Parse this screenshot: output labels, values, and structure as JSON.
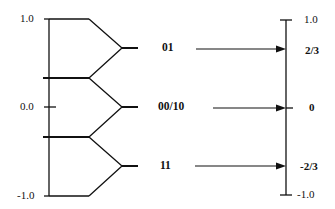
{
  "diagram": {
    "left_axis": {
      "ticks": [
        {
          "label": "1.0",
          "value": 1.0
        },
        {
          "label": "0.0",
          "value": 0.0
        },
        {
          "label": "-1.0",
          "value": -1.0
        }
      ],
      "boundaries": [
        1.0,
        0.333,
        -0.333,
        -1.0
      ]
    },
    "codes": [
      {
        "label": "01",
        "target": "2/3"
      },
      {
        "label": "00/10",
        "target": "0"
      },
      {
        "label": "11",
        "target": "-2/3"
      }
    ],
    "right_axis": {
      "ticks": [
        {
          "label": "1.0",
          "value": 1.0,
          "bold": false
        },
        {
          "label": "2/3",
          "value": 0.667,
          "bold": true
        },
        {
          "label": "0",
          "value": 0.0,
          "bold": true
        },
        {
          "label": "-2/3",
          "value": -0.667,
          "bold": true
        },
        {
          "label": "-1.0",
          "value": -1.0,
          "bold": false
        }
      ]
    },
    "colors": {
      "stroke": "#111111",
      "background": "#ffffff"
    }
  }
}
